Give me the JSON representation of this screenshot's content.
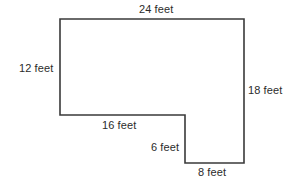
{
  "figure": {
    "type": "geometry-diagram",
    "stroke_color": "#3a3a3a",
    "fill_color": "#ffffff",
    "label_color": "#2b2b2b",
    "unit": "feet",
    "labels": {
      "top": "24 feet",
      "left": "12 feet",
      "right": "18 feet",
      "middle": "16 feet",
      "notch": "6 feet",
      "bottom": "8 feet"
    },
    "sides": [
      {
        "name": "top",
        "value": 24,
        "unit": "feet",
        "orientation": "horizontal"
      },
      {
        "name": "left",
        "value": 12,
        "unit": "feet",
        "orientation": "vertical"
      },
      {
        "name": "middle",
        "value": 16,
        "unit": "feet",
        "orientation": "horizontal"
      },
      {
        "name": "notch",
        "value": 6,
        "unit": "feet",
        "orientation": "vertical"
      },
      {
        "name": "bottom",
        "value": 8,
        "unit": "feet",
        "orientation": "horizontal"
      },
      {
        "name": "right",
        "value": 18,
        "unit": "feet",
        "orientation": "vertical"
      }
    ],
    "outline_points": "60,19 244,19 244,163 185,163 185,115 60,115"
  }
}
